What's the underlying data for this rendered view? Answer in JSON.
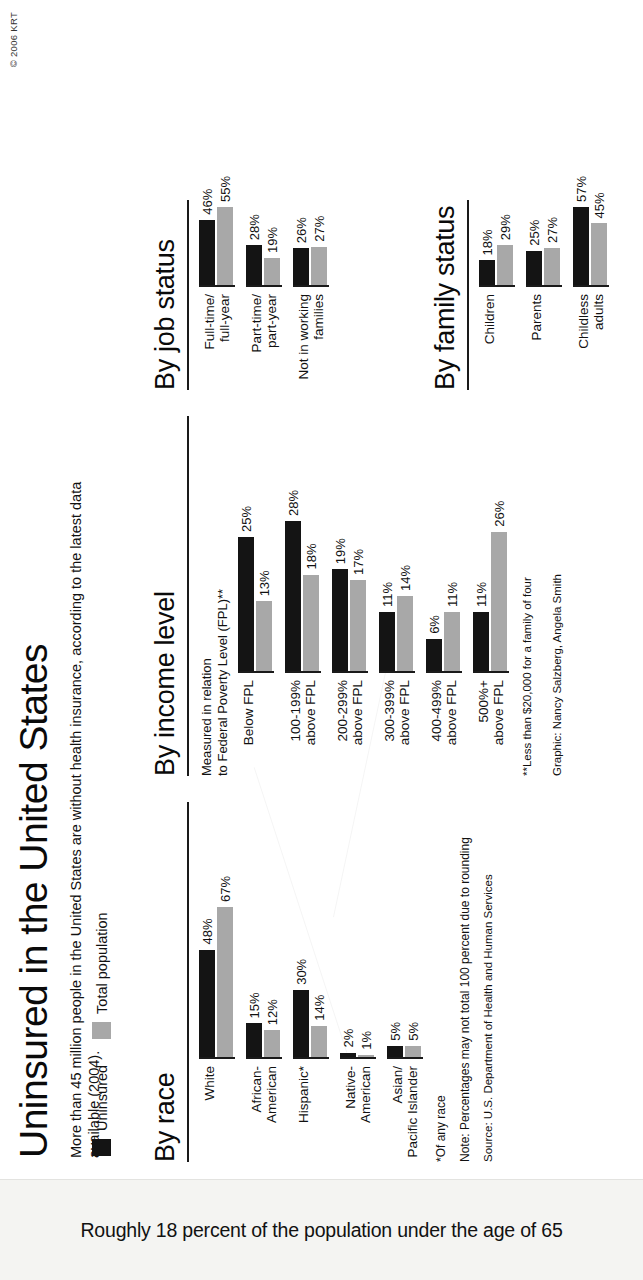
{
  "title": "Uninsured in the United States",
  "deck": "More than 45 million people in the United States are without health insurance, according to the latest data available (2004).",
  "copyright": "© 2006 KRT",
  "caption": "Roughly 18 percent of the population under the age of 65",
  "legend": {
    "items": [
      {
        "label": "Uninsured",
        "color": "#141414"
      },
      {
        "label": "Total population",
        "color": "#a8a8a8"
      }
    ]
  },
  "panels": {
    "race": {
      "title": "By race",
      "footnote": "*Of any race",
      "note": "Note: Percentages may not total 100 percent due to rounding",
      "source": "Source: U.S. Department of Health and Human Services"
    },
    "income": {
      "title": "By income level",
      "subtitle": "Measured in relation\nto Federal Poverty Level (FPL)**",
      "footnote": "**Less than $20,000 for a family of four",
      "credit": "Graphic: Nancy Salzberg, Angela Smith"
    },
    "job": {
      "title": "By job status"
    },
    "family": {
      "title": "By family status"
    }
  },
  "chart_data": [
    {
      "type": "bar",
      "title": "By race",
      "xlabel": "",
      "ylabel": "Percent",
      "ylim": [
        0,
        70
      ],
      "grid": false,
      "legend_position": "top-left",
      "categories": [
        "White",
        "African-American",
        "Hispanic*",
        "Native-American",
        "Asian/ Pacific Islander"
      ],
      "category_labels": [
        "White",
        "African-\nAmerican",
        "Hispanic*",
        "Native-\nAmerican",
        "Asian/\nPacific Islander"
      ],
      "series": [
        {
          "name": "Uninsured",
          "color": "#141414",
          "values": [
            48,
            15,
            30,
            2,
            5
          ],
          "value_labels": [
            "48%",
            "15%",
            "30%",
            "2%",
            "5%"
          ]
        },
        {
          "name": "Total population",
          "color": "#a8a8a8",
          "values": [
            67,
            12,
            14,
            1,
            5
          ],
          "value_labels": [
            "67%",
            "12%",
            "14%",
            "1%",
            "5%"
          ]
        }
      ]
    },
    {
      "type": "bar",
      "title": "By income level",
      "subtitle": "Measured in relation to Federal Poverty Level (FPL)**",
      "xlabel": "",
      "ylabel": "Percent",
      "ylim": [
        0,
        30
      ],
      "grid": false,
      "categories": [
        "Below FPL",
        "100-199% above FPL",
        "200-299% above FPL",
        "300-399% above FPL",
        "400-499% above FPL",
        "500%+ above FPL"
      ],
      "category_labels": [
        "Below FPL",
        "100-199%\nabove FPL",
        "200-299%\nabove FPL",
        "300-399%\nabove FPL",
        "400-499%\nabove FPL",
        "500%+\nabove FPL"
      ],
      "series": [
        {
          "name": "Uninsured",
          "color": "#141414",
          "values": [
            25,
            28,
            19,
            11,
            6,
            11
          ],
          "value_labels": [
            "25%",
            "28%",
            "19%",
            "11%",
            "6%",
            "11%"
          ]
        },
        {
          "name": "Total population",
          "color": "#a8a8a8",
          "values": [
            13,
            18,
            17,
            14,
            11,
            26
          ],
          "value_labels": [
            "13%",
            "18%",
            "17%",
            "14%",
            "11%",
            "26%"
          ]
        }
      ]
    },
    {
      "type": "bar",
      "title": "By job status",
      "xlabel": "",
      "ylabel": "Percent",
      "ylim": [
        0,
        60
      ],
      "grid": false,
      "categories": [
        "Full-time/full-year",
        "Part-time/part-year",
        "Not in working families"
      ],
      "category_labels": [
        "Full-time/\nfull-year",
        "Part-time/\npart-year",
        "Not in working\nfamilies"
      ],
      "series": [
        {
          "name": "Uninsured",
          "color": "#141414",
          "values": [
            46,
            28,
            26
          ],
          "value_labels": [
            "46%",
            "28%",
            "26%"
          ]
        },
        {
          "name": "Total population",
          "color": "#a8a8a8",
          "values": [
            55,
            19,
            27
          ],
          "value_labels": [
            "55%",
            "19%",
            "27%"
          ]
        }
      ]
    },
    {
      "type": "bar",
      "title": "By family status",
      "xlabel": "",
      "ylabel": "Percent",
      "ylim": [
        0,
        60
      ],
      "grid": false,
      "categories": [
        "Children",
        "Parents",
        "Childless adults"
      ],
      "category_labels": [
        "Children",
        "Parents",
        "Childless\nadults"
      ],
      "series": [
        {
          "name": "Uninsured",
          "color": "#141414",
          "values": [
            18,
            25,
            57
          ],
          "value_labels": [
            "18%",
            "25%",
            "57%"
          ]
        },
        {
          "name": "Total population",
          "color": "#a8a8a8",
          "values": [
            29,
            27,
            45
          ],
          "value_labels": [
            "29%",
            "27%",
            "45%"
          ]
        }
      ]
    }
  ]
}
